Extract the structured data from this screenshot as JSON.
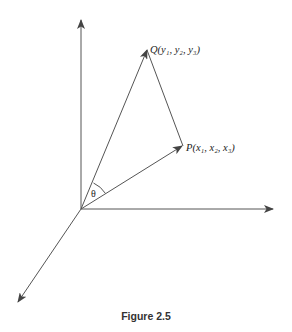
{
  "diagram": {
    "caption": "Figure 2.5",
    "points": {
      "Q": {
        "name": "Q",
        "coords": "(y₁, y₂, y₃)",
        "label": "Q(y₁, y₂, y₃)"
      },
      "P": {
        "name": "P",
        "coords": "(x₁, x₂, x₃)",
        "label": "P(x₁, x₂, x₃)"
      }
    },
    "angle_label": "θ",
    "elements": [
      "vertical axis (arrow up)",
      "horizontal axis (arrow right)",
      "diagonal axis (arrow down-left)",
      "vector from origin to Q",
      "vector from origin to P",
      "segment from P to Q",
      "angle arc theta between OQ and OP"
    ],
    "colors": {
      "line": "#555555",
      "text": "#222222",
      "background": "#ffffff"
    }
  }
}
